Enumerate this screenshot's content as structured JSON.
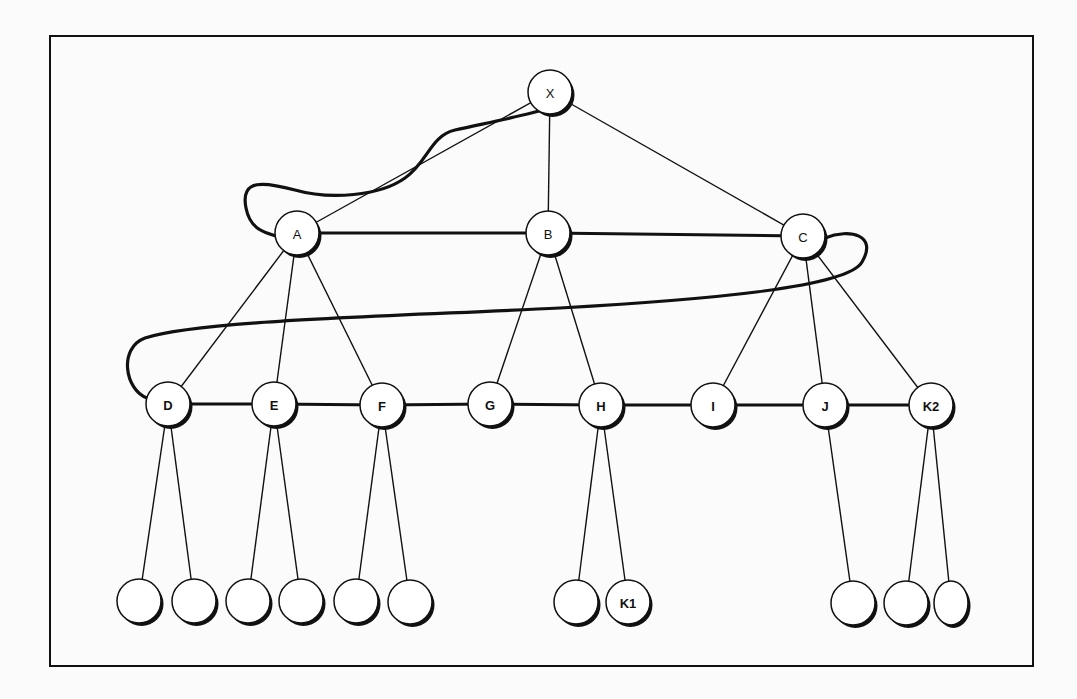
{
  "figure": {
    "frame": {
      "x": 50,
      "y": 36,
      "w": 983,
      "h": 630
    },
    "colors": {
      "line": "#111111",
      "fill": "#ffffff",
      "shadow": "#111111",
      "background": "#fbfbfb"
    },
    "node_radius": 22,
    "nodes": [
      {
        "id": "X",
        "label": "X",
        "x": 550,
        "y": 92
      },
      {
        "id": "A",
        "label": "A",
        "x": 297,
        "y": 233
      },
      {
        "id": "B",
        "label": "B",
        "x": 548,
        "y": 233
      },
      {
        "id": "C",
        "label": "C",
        "x": 803,
        "y": 236
      },
      {
        "id": "D",
        "label": "D",
        "x": 168,
        "y": 404,
        "bold": true
      },
      {
        "id": "E",
        "label": "E",
        "x": 274,
        "y": 404,
        "bold": true
      },
      {
        "id": "F",
        "label": "F",
        "x": 382,
        "y": 405,
        "bold": true
      },
      {
        "id": "G",
        "label": "G",
        "x": 490,
        "y": 404,
        "bold": true
      },
      {
        "id": "H",
        "label": "H",
        "x": 601,
        "y": 405,
        "bold": true
      },
      {
        "id": "I",
        "label": "I",
        "x": 713,
        "y": 405,
        "bold": true
      },
      {
        "id": "J",
        "label": "J",
        "x": 825,
        "y": 405,
        "bold": true
      },
      {
        "id": "K2",
        "label": "K2",
        "x": 931,
        "y": 405,
        "bold": true
      },
      {
        "id": "D1",
        "label": "",
        "x": 139,
        "y": 601
      },
      {
        "id": "D2",
        "label": "",
        "x": 194,
        "y": 601
      },
      {
        "id": "E1",
        "label": "",
        "x": 248,
        "y": 601
      },
      {
        "id": "E2",
        "label": "",
        "x": 301,
        "y": 601
      },
      {
        "id": "F1",
        "label": "",
        "x": 356,
        "y": 601
      },
      {
        "id": "F2",
        "label": "",
        "x": 410,
        "y": 602
      },
      {
        "id": "H1",
        "label": "",
        "x": 576,
        "y": 602
      },
      {
        "id": "K1",
        "label": "K1",
        "x": 628,
        "y": 602,
        "bold": true
      },
      {
        "id": "J1",
        "label": "",
        "x": 853,
        "y": 603
      },
      {
        "id": "K2a",
        "label": "",
        "x": 906,
        "y": 603
      },
      {
        "id": "K2b",
        "label": "",
        "x": 951,
        "y": 603,
        "rx": 17
      }
    ],
    "thin_edges": [
      [
        "X",
        "A"
      ],
      [
        "X",
        "B"
      ],
      [
        "X",
        "C"
      ],
      [
        "A",
        "D"
      ],
      [
        "A",
        "E"
      ],
      [
        "A",
        "F"
      ],
      [
        "B",
        "G"
      ],
      [
        "B",
        "H"
      ],
      [
        "C",
        "I"
      ],
      [
        "C",
        "J"
      ],
      [
        "C",
        "K2"
      ],
      [
        "D",
        "D1"
      ],
      [
        "D",
        "D2"
      ],
      [
        "E",
        "E1"
      ],
      [
        "E",
        "E2"
      ],
      [
        "F",
        "F1"
      ],
      [
        "F",
        "F2"
      ],
      [
        "H",
        "H1"
      ],
      [
        "H",
        "K1"
      ],
      [
        "J",
        "J1"
      ],
      [
        "K2",
        "K2a"
      ],
      [
        "K2",
        "K2b"
      ]
    ],
    "thick_edges": [
      [
        "A",
        "B"
      ],
      [
        "B",
        "C"
      ],
      [
        "D",
        "E"
      ],
      [
        "E",
        "F"
      ],
      [
        "F",
        "G"
      ],
      [
        "G",
        "H"
      ],
      [
        "H",
        "I"
      ],
      [
        "I",
        "J"
      ],
      [
        "J",
        "K2"
      ]
    ],
    "curve_path": "M 572 100 C 545 112, 500 120, 455 130 C 430 136, 428 162, 405 178 C 380 196, 330 200, 295 190 C 265 182, 240 178, 246 208 C 250 228, 262 232, 276 236 M 825 238 C 850 228, 878 235, 862 262 C 848 288, 700 300, 560 308 C 400 316, 200 320, 145 338 C 118 348, 125 390, 147 398"
  }
}
